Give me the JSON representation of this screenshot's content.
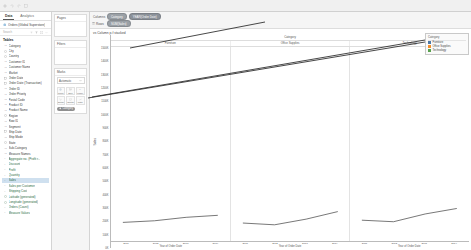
{
  "app": {
    "title": "Tableau Desktop"
  },
  "data_pane": {
    "tab_data": "Data",
    "tab_analytics": "Analytics",
    "datasource": "Orders (Global Superstore)",
    "search_placeholder": "Search",
    "section_tables": "Tables",
    "fields": [
      {
        "label": "Category",
        "kind": "dimension"
      },
      {
        "label": "City",
        "kind": "dimension"
      },
      {
        "label": "Country",
        "kind": "dimension"
      },
      {
        "label": "Customer ID",
        "kind": "dimension"
      },
      {
        "label": "Customer Name",
        "kind": "dimension"
      },
      {
        "label": "Market",
        "kind": "dimension"
      },
      {
        "label": "Order Date",
        "kind": "date"
      },
      {
        "label": "Order Date (Transaction)",
        "kind": "date"
      },
      {
        "label": "Order ID",
        "kind": "dimension"
      },
      {
        "label": "Order Priority",
        "kind": "dimension"
      },
      {
        "label": "Postal Code",
        "kind": "dimension"
      },
      {
        "label": "Product ID",
        "kind": "dimension"
      },
      {
        "label": "Product Name",
        "kind": "dimension"
      },
      {
        "label": "Region",
        "kind": "dimension"
      },
      {
        "label": "Row ID",
        "kind": "dimension"
      },
      {
        "label": "Segment",
        "kind": "dimension"
      },
      {
        "label": "Ship Date",
        "kind": "date"
      },
      {
        "label": "Ship Mode",
        "kind": "dimension"
      },
      {
        "label": "State",
        "kind": "dimension"
      },
      {
        "label": "Sub-Category",
        "kind": "dimension"
      },
      {
        "label": "Measure Names",
        "kind": "dimension"
      },
      {
        "label": "Aggregate no. (Profit r...",
        "kind": "measure"
      },
      {
        "label": "Discount",
        "kind": "measure"
      },
      {
        "label": "Profit",
        "kind": "measure"
      },
      {
        "label": "Quantity",
        "kind": "measure"
      },
      {
        "label": "Sales",
        "kind": "measure",
        "selected": true
      },
      {
        "label": "Sales per Customer",
        "kind": "measure"
      },
      {
        "label": "Shipping Cost",
        "kind": "measure"
      },
      {
        "label": "Latitude (generated)",
        "kind": "measure"
      },
      {
        "label": "Longitude (generated)",
        "kind": "measure"
      },
      {
        "label": "Orders (Count)",
        "kind": "measure"
      },
      {
        "label": "Measure Values",
        "kind": "measure"
      }
    ]
  },
  "cards": {
    "pages_title": "Pages",
    "filters_title": "Filters",
    "marks_title": "Marks",
    "marks_type": "Automatic",
    "mark_buttons": [
      {
        "label": "Color",
        "icon": "color-icon"
      },
      {
        "label": "Size",
        "icon": "size-icon"
      },
      {
        "label": "Label",
        "icon": "label-icon"
      },
      {
        "label": "Detail",
        "icon": "detail-icon"
      },
      {
        "label": "Tooltip",
        "icon": "tooltip-icon"
      },
      {
        "label": "Path",
        "icon": "path-icon"
      }
    ],
    "marks_pill": "Category"
  },
  "shelves": {
    "columns_label": "Columns",
    "rows_label": "Rows",
    "columns_pills": [
      "Category",
      "YEAR(Order Date)"
    ],
    "rows_pills": [
      "SUM(Sales)"
    ]
  },
  "sheet": {
    "title": "vs Column p-f stacked"
  },
  "legend": {
    "title": "Category",
    "items": [
      {
        "label": "Furniture",
        "color": "#4e79a7"
      },
      {
        "label": "Office Supplies",
        "color": "#f28e2b"
      },
      {
        "label": "Technology",
        "color": "#59a14f"
      }
    ]
  },
  "chart_data": {
    "type": "line",
    "title": "vs Column p-f stacked",
    "xlabel": "Year of Order Date",
    "ylabel": "Sales",
    "column_group_title": "Category",
    "grid": false,
    "legend_position": "right",
    "ylim": [
      0,
      1600000
    ],
    "ytick_labels": [
      "0K",
      "100K",
      "200K",
      "300K",
      "400K",
      "500K",
      "600K",
      "700K",
      "800K",
      "900K",
      "1000K",
      "1100K",
      "1200K",
      "1300K",
      "1400K",
      "1500K"
    ],
    "ytick_values": [
      0,
      100000,
      200000,
      300000,
      400000,
      500000,
      600000,
      700000,
      800000,
      900000,
      1000000,
      1100000,
      1200000,
      1300000,
      1400000,
      1500000
    ],
    "x": [
      "2011",
      "2012",
      "2013",
      "2014"
    ],
    "panels": [
      {
        "name": "Furniture",
        "color": "#4e79a7",
        "values": [
          157193,
          170518,
          198901,
          215387
        ]
      },
      {
        "name": "Office Supplies",
        "color": "#f28e2b",
        "values": [
          151776,
          137233,
          183940,
          246097
        ]
      },
      {
        "name": "Technology",
        "color": "#59a14f",
        "values": [
          175278,
          162781,
          226364,
          271730
        ]
      }
    ],
    "series": [
      {
        "name": "Furniture",
        "values": [
          157193,
          170518,
          198901,
          215387
        ]
      },
      {
        "name": "Office Supplies",
        "values": [
          151776,
          137233,
          183940,
          246097
        ]
      },
      {
        "name": "Technology",
        "values": [
          175278,
          162781,
          226364,
          271730
        ]
      }
    ],
    "categories": [
      "2011",
      "2012",
      "2013",
      "2014"
    ]
  },
  "annotations": {
    "arrow_to_columns": "pointer-line-to-columns-shelf",
    "arrow_to_legend": "pointer-line-to-color-legend",
    "arrow_to_marks": "pointer-line-to-marks-card"
  }
}
